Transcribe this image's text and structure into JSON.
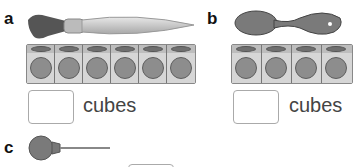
{
  "items": [
    {
      "label": "a",
      "object": "paintbrush",
      "cube_count": 6,
      "answer_value": "",
      "unit": "cubes"
    },
    {
      "label": "b",
      "object": "spoon",
      "cube_count": 4,
      "answer_value": "",
      "unit": "cubes"
    },
    {
      "label": "c",
      "object": "lollipop",
      "cube_count": 0,
      "answer_value": "",
      "unit": ""
    }
  ]
}
